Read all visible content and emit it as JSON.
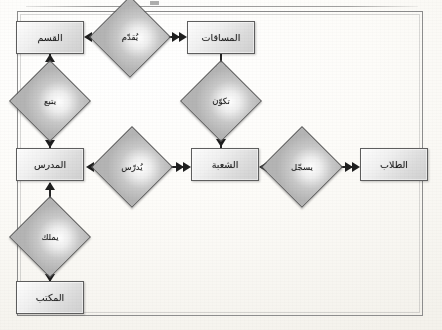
{
  "diagram": {
    "kind": "entity-relationship-diagram",
    "language": "ar",
    "title_text": "",
    "frame_visible": true,
    "colors": {
      "shape_border": "#5e5e5e",
      "shape_fill_light": "#fdfdfd",
      "shape_fill_dark": "#cfcfcf",
      "connector": "#262626",
      "frame": "#8d8d8d",
      "paper": "#fbfaf7"
    }
  },
  "entities": [
    {
      "id": "department",
      "label": "القسم",
      "x": 16,
      "y": 21,
      "w": 68,
      "h": 33
    },
    {
      "id": "courses",
      "label": "المساقات",
      "x": 187,
      "y": 21,
      "w": 68,
      "h": 33
    },
    {
      "id": "instructor",
      "label": "المدرس",
      "x": 16,
      "y": 148,
      "w": 68,
      "h": 33
    },
    {
      "id": "section",
      "label": "الشعبة",
      "x": 191,
      "y": 148,
      "w": 68,
      "h": 33
    },
    {
      "id": "students",
      "label": "الطلاب",
      "x": 360,
      "y": 148,
      "w": 68,
      "h": 33
    },
    {
      "id": "office",
      "label": "المكتب",
      "x": 16,
      "y": 281,
      "w": 68,
      "h": 33
    }
  ],
  "relationships": [
    {
      "id": "offers",
      "label": "يُقدّم",
      "cx": 130,
      "cy": 37
    },
    {
      "id": "forms",
      "label": "تكوّن",
      "cx": 221,
      "cy": 101
    },
    {
      "id": "belongs",
      "label": "يتبع",
      "cx": 50,
      "cy": 101
    },
    {
      "id": "teaches",
      "label": "يُدرّس",
      "cx": 132,
      "cy": 167
    },
    {
      "id": "registers",
      "label": "يسجّل",
      "cx": 302,
      "cy": 167
    },
    {
      "id": "owns",
      "label": "يملك",
      "cx": 50,
      "cy": 237
    }
  ],
  "connectors": [
    {
      "id": "offers-to-department",
      "from": "offers",
      "to": "department",
      "direction": "left",
      "arrowheads": 2
    },
    {
      "id": "offers-to-courses",
      "from": "offers",
      "to": "courses",
      "direction": "right",
      "arrowheads": 2
    },
    {
      "id": "courses-to-forms",
      "from": "courses",
      "to": "forms",
      "direction": "down",
      "arrowheads": 1
    },
    {
      "id": "forms-to-section",
      "from": "forms",
      "to": "section",
      "direction": "down",
      "arrowheads": 1
    },
    {
      "id": "belongs-to-department",
      "from": "belongs",
      "to": "department",
      "direction": "up",
      "arrowheads": 1
    },
    {
      "id": "belongs-to-instructor",
      "from": "belongs",
      "to": "instructor",
      "direction": "down",
      "arrowheads": 2
    },
    {
      "id": "teaches-to-instructor",
      "from": "teaches",
      "to": "instructor",
      "direction": "left",
      "arrowheads": 1
    },
    {
      "id": "teaches-to-section",
      "from": "teaches",
      "to": "section",
      "direction": "right",
      "arrowheads": 2
    },
    {
      "id": "registers-to-section",
      "from": "registers",
      "to": "section",
      "direction": "left",
      "arrowheads": 2
    },
    {
      "id": "registers-to-students",
      "from": "registers",
      "to": "students",
      "direction": "right",
      "arrowheads": 2
    },
    {
      "id": "instructor-to-owns",
      "from": "instructor",
      "to": "owns",
      "direction": "up",
      "arrowheads": 1
    },
    {
      "id": "owns-to-office",
      "from": "owns",
      "to": "office",
      "direction": "down",
      "arrowheads": 1
    }
  ]
}
